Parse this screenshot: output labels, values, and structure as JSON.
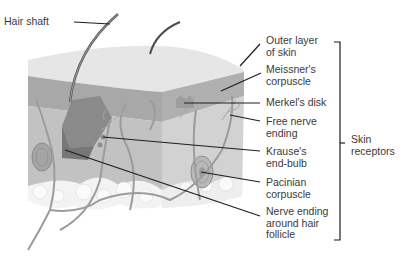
{
  "figure": {
    "labels": {
      "hair_shaft": "Hair shaft",
      "outer_layer": "Outer layer\nof skin",
      "meissner": "Meissner's\ncorpuscle",
      "merkel": "Merkel's disk",
      "free_nerve": "Free nerve\nending",
      "krause": "Krause's\nend-bulb",
      "pacinian": "Pacinian\ncorpuscle",
      "hair_follicle": "Nerve ending\naround hair\nfollicle",
      "group": "Skin\nreceptors"
    },
    "colors": {
      "top_surface": "#e4e4e4",
      "epidermis": "#a9a9a9",
      "dermis": "#c4c4c4",
      "side_face": "#d0d0d0",
      "fat": "#f2f2f2",
      "nerve": "#9a9a9a",
      "leader_line": "#1e1e1e"
    }
  }
}
